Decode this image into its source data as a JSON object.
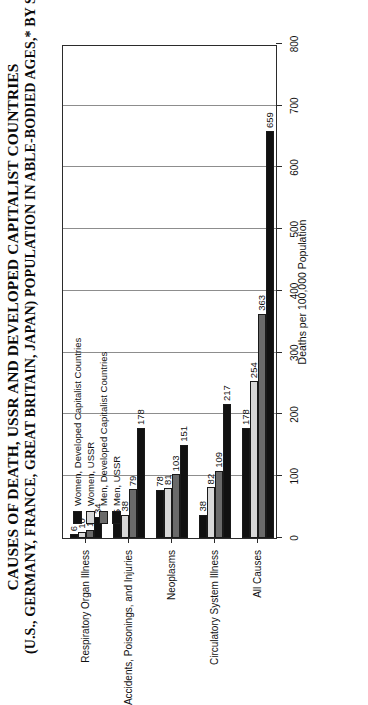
{
  "title": {
    "line1": "CAUSES OF DEATH, USSR AND DEVELOPED CAPITALIST COUNTRIES",
    "line2": "(U.S., GERMANY, FRANCE, GREAT BRITAIN, JAPAN) POPULATION IN ABLE-BODIED AGES,* BY SEX: 1987"
  },
  "legend": {
    "items": [
      {
        "label": "Women, Developed Capitalist Countries",
        "color": "#111111"
      },
      {
        "label": "Women, USSR",
        "color": "#d8d8d8"
      },
      {
        "label": "Men, Developed Capitalist Countries",
        "color": "#6a6a6a"
      },
      {
        "label": "Men, USSR",
        "color": "#111111"
      }
    ]
  },
  "chart_data": {
    "type": "bar",
    "orientation": "horizontal",
    "title": "CAUSES OF DEATH, USSR AND DEVELOPED CAPITALIST COUNTRIES (U.S., GERMANY, FRANCE, GREAT BRITAIN, JAPAN) POPULATION IN ABLE-BODIED AGES,* BY SEX: 1987",
    "xlabel": "Deaths per 100,000 Population",
    "ylabel": "",
    "xlim": [
      0,
      800
    ],
    "xticks": [
      0,
      100,
      200,
      300,
      400,
      500,
      600,
      700,
      800
    ],
    "grid": true,
    "legend_position": "upper-left-inside",
    "categories": [
      "Respiratory Organ Illness",
      "Accidents, Poisonings, and Injuries",
      "Neoplasms",
      "Circulatory System Illness",
      "All Causes"
    ],
    "series": [
      {
        "name": "Women, Developed Capitalist Countries",
        "color": "#111111",
        "values": [
          6,
          25,
          78,
          38,
          178
        ]
      },
      {
        "name": "Women, USSR",
        "color": "#d8d8d8",
        "values": [
          10,
          38,
          81,
          82,
          254
        ]
      },
      {
        "name": "Men, Developed Capitalist Countries",
        "color": "#6a6a6a",
        "values": [
          13,
          79,
          103,
          109,
          363
        ]
      },
      {
        "name": "Men, USSR",
        "color": "#111111",
        "values": [
          34,
          178,
          151,
          217,
          659
        ]
      }
    ]
  }
}
